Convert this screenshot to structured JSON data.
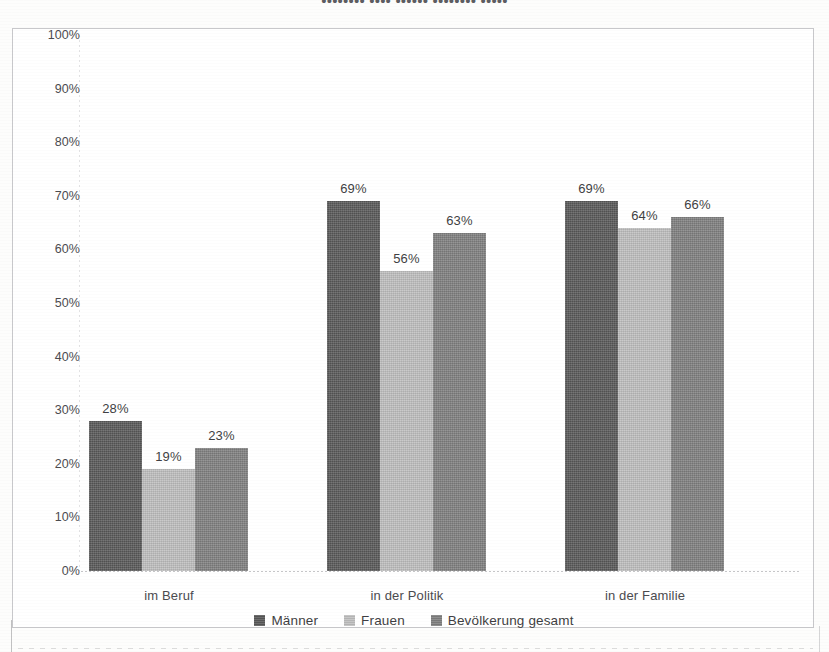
{
  "chart_data": {
    "type": "bar",
    "title": "",
    "xlabel": "",
    "ylabel": "",
    "ylim": [
      0,
      100
    ],
    "ytick_labels": [
      "100%",
      "90%",
      "80%",
      "70%",
      "60%",
      "50%",
      "40%",
      "30%",
      "20%",
      "10%",
      "0%"
    ],
    "ytick_values": [
      100,
      90,
      80,
      70,
      60,
      50,
      40,
      30,
      20,
      10,
      0
    ],
    "grid": false,
    "legend_position": "bottom",
    "categories": [
      "im Beruf",
      "in der Politik",
      "in der Familie"
    ],
    "series": [
      {
        "name": "Männer",
        "color": "#595959",
        "values": [
          28,
          19,
          23
        ],
        "labels": [
          "28%",
          "19%",
          "23%"
        ]
      },
      {
        "name": "Frauen",
        "color": "#bfbfbf",
        "values": [
          69,
          56,
          63
        ],
        "labels": [
          "69%",
          "56%",
          "63%"
        ]
      },
      {
        "name": "Bevölkerung gesamt",
        "color": "#808080",
        "values": [
          69,
          64,
          66
        ],
        "labels": [
          "69%",
          "64%",
          "66%"
        ]
      }
    ],
    "groups": [
      {
        "category": "im Beruf",
        "bars": [
          {
            "series": "Männer",
            "value": 28,
            "label": "28%",
            "color": "#595959"
          },
          {
            "series": "Frauen",
            "value": 19,
            "label": "19%",
            "color": "#bfbfbf"
          },
          {
            "series": "Bevölkerung gesamt",
            "value": 23,
            "label": "23%",
            "color": "#808080"
          }
        ]
      },
      {
        "category": "in der Politik",
        "bars": [
          {
            "series": "Männer",
            "value": 69,
            "label": "69%",
            "color": "#595959"
          },
          {
            "series": "Frauen",
            "value": 56,
            "label": "56%",
            "color": "#bfbfbf"
          },
          {
            "series": "Bevölkerung gesamt",
            "value": 63,
            "label": "63%",
            "color": "#808080"
          }
        ]
      },
      {
        "category": "in der Familie",
        "bars": [
          {
            "series": "Männer",
            "value": 69,
            "label": "69%",
            "color": "#595959"
          },
          {
            "series": "Frauen",
            "value": 64,
            "label": "64%",
            "color": "#bfbfbf"
          },
          {
            "series": "Bevölkerung gesamt",
            "value": 66,
            "label": "66%",
            "color": "#808080"
          }
        ]
      }
    ]
  },
  "scan": {
    "top_cut_text": "••••••••  ••••  ••••••  ••••••••  •••••"
  }
}
